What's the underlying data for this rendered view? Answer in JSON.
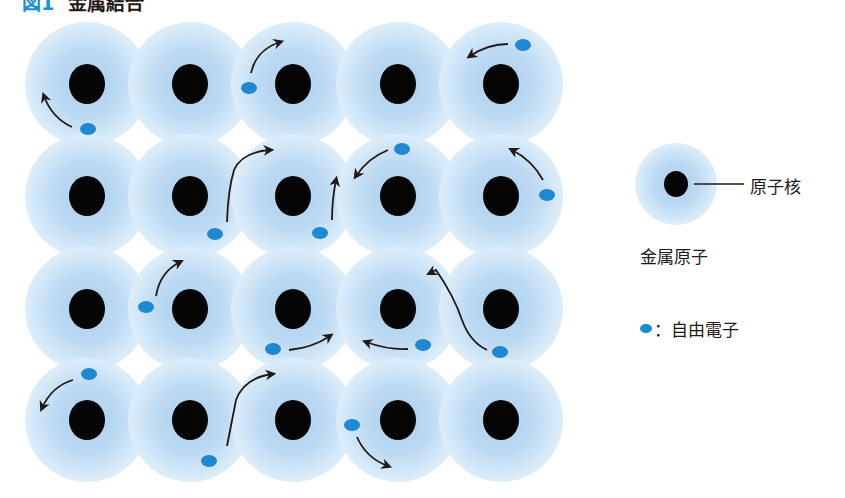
{
  "title": {
    "figure_label": "図1",
    "text": "金属結合"
  },
  "colors": {
    "atom_center": "#a9cdee",
    "atom_edge": "#ddeefa",
    "nucleus": "#050505",
    "electron": "#1e88d2",
    "arrow": "#231815"
  },
  "lattice": {
    "columns_x": [
      87,
      190,
      293,
      398,
      501
    ],
    "rows_y": [
      84,
      196,
      309,
      420
    ],
    "atom_radius": 62,
    "nucleus_rx": 18,
    "nucleus_ry": 20
  },
  "electrons": [
    {
      "x": 88,
      "y": 129
    },
    {
      "x": 249,
      "y": 88
    },
    {
      "x": 523,
      "y": 45
    },
    {
      "x": 215,
      "y": 234
    },
    {
      "x": 320,
      "y": 233
    },
    {
      "x": 402,
      "y": 149
    },
    {
      "x": 547,
      "y": 195
    },
    {
      "x": 146,
      "y": 307
    },
    {
      "x": 273,
      "y": 349
    },
    {
      "x": 423,
      "y": 345
    },
    {
      "x": 500,
      "y": 352
    },
    {
      "x": 89,
      "y": 374
    },
    {
      "x": 209,
      "y": 461
    },
    {
      "x": 352,
      "y": 425
    }
  ],
  "arrows": [
    {
      "d": "M72 127 Q52 118 44 96"
    },
    {
      "d": "M251 73 Q256 50 280 42"
    },
    {
      "d": "M508 44 Q488 44 470 56"
    },
    {
      "d": "M227 222 Q228 190 234 170 Q242 152 270 150"
    },
    {
      "d": "M332 220 Q332 200 336 180"
    },
    {
      "d": "M388 150 Q368 158 356 176"
    },
    {
      "d": "M543 180 Q532 160 512 150"
    },
    {
      "d": "M156 296 Q160 272 180 262"
    },
    {
      "d": "M289 350 Q312 348 330 336"
    },
    {
      "d": "M408 349 Q388 350 366 342"
    },
    {
      "d": "M487 350 Q470 342 462 320 Q454 296 436 270 L430 273"
    },
    {
      "d": "M73 380 Q52 386 42 408"
    },
    {
      "d": "M227 446 Q232 420 236 400 Q244 378 272 374"
    },
    {
      "d": "M357 437 Q366 458 388 466"
    }
  ],
  "legend": {
    "atom": {
      "cx": 676,
      "cy": 184,
      "r": 41
    },
    "nucleus_label": "原子核",
    "atom_label": "金属原子",
    "electron_label": "：自由電子"
  }
}
